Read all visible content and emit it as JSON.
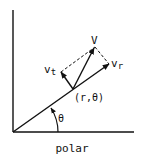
{
  "diagram": {
    "title": "polar",
    "labels": {
      "v": "V",
      "vt_main": "v",
      "vt_sub": "t",
      "vr_main": "v",
      "vr_sub": "r",
      "point": "(r,θ)",
      "angle": "θ",
      "caption": "polar"
    },
    "colors": {
      "line": "#111111",
      "background": "#ffffff"
    }
  }
}
